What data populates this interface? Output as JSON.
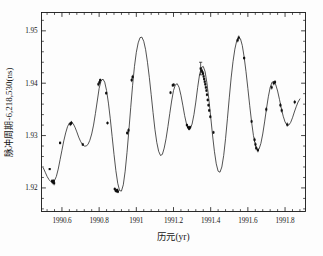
{
  "figure": {
    "background_color": "#fdfdfd",
    "ink_color": "#151515"
  },
  "axes": {
    "x_axis_label": "历元(yr)",
    "y_axis_label": "脉冲周期-6,218,530(ns)",
    "x_tick_labels": [
      "1990.6",
      "1990.8",
      "1991",
      "1991.2",
      "1991.4",
      "1991.6",
      "1991.8"
    ],
    "x_tick_values": [
      1990.6,
      1990.8,
      1991.0,
      1991.2,
      1991.4,
      1991.6,
      1991.8
    ],
    "y_tick_labels": [
      "1.92",
      "1.93",
      "1.94",
      "1.95"
    ],
    "y_tick_values": [
      1.92,
      1.93,
      1.94,
      1.95
    ]
  },
  "chart_data": {
    "type": "scatter",
    "title": "",
    "subtitle": "",
    "xlabel": "历元(yr)",
    "ylabel": "脉冲周期-6,218,530(ns)",
    "xlim": [
      1990.49,
      1991.91
    ],
    "ylim": [
      1.9155,
      1.9535
    ],
    "grid": false,
    "legend": null,
    "minor_ticks": true,
    "ticks_inward": true,
    "series": [
      {
        "name": "模型拟合曲线",
        "type": "line",
        "comment": "smooth quasi-sinusoidal model curve sampled densely",
        "x": [
          1990.5,
          1990.51,
          1990.52,
          1990.53,
          1990.54,
          1990.55,
          1990.56,
          1990.57,
          1990.58,
          1990.59,
          1990.6,
          1990.61,
          1990.62,
          1990.63,
          1990.64,
          1990.65,
          1990.66,
          1990.67,
          1990.68,
          1990.69,
          1990.7,
          1990.71,
          1990.72,
          1990.73,
          1990.74,
          1990.75,
          1990.76,
          1990.77,
          1990.78,
          1990.79,
          1990.8,
          1990.81,
          1990.82,
          1990.83,
          1990.84,
          1990.85,
          1990.86,
          1990.87,
          1990.88,
          1990.89,
          1990.9,
          1990.91,
          1990.92,
          1990.93,
          1990.94,
          1990.95,
          1990.96,
          1990.97,
          1990.98,
          1990.99,
          1991.0,
          1991.01,
          1991.02,
          1991.03,
          1991.04,
          1991.05,
          1991.06,
          1991.07,
          1991.08,
          1991.09,
          1991.1,
          1991.11,
          1991.12,
          1991.13,
          1991.14,
          1991.15,
          1991.16,
          1991.17,
          1991.18,
          1991.19,
          1991.2,
          1991.21,
          1991.22,
          1991.23,
          1991.24,
          1991.25,
          1991.26,
          1991.27,
          1991.28,
          1991.29,
          1991.3,
          1991.31,
          1991.32,
          1991.33,
          1991.34,
          1991.35,
          1991.36,
          1991.37,
          1991.38,
          1991.39,
          1991.4,
          1991.41,
          1991.42,
          1991.43,
          1991.44,
          1991.45,
          1991.46,
          1991.47,
          1991.48,
          1991.49,
          1991.5,
          1991.51,
          1991.52,
          1991.53,
          1991.54,
          1991.55,
          1991.56,
          1991.57,
          1991.58,
          1991.59,
          1991.6,
          1991.61,
          1991.62,
          1991.63,
          1991.64,
          1991.65,
          1991.66,
          1991.67,
          1991.68,
          1991.69,
          1991.7,
          1991.71,
          1991.72,
          1991.73,
          1991.74,
          1991.75,
          1991.76,
          1991.77,
          1991.78,
          1991.79,
          1991.8,
          1991.81,
          1991.82,
          1991.83,
          1991.84,
          1991.85,
          1991.86,
          1991.87,
          1991.88
        ],
        "y": [
          1.9238,
          1.923,
          1.9222,
          1.9216,
          1.9212,
          1.9211,
          1.9214,
          1.9222,
          1.9236,
          1.9254,
          1.9272,
          1.929,
          1.9305,
          1.9317,
          1.9324,
          1.9326,
          1.9323,
          1.9316,
          1.9307,
          1.9297,
          1.9289,
          1.9283,
          1.928,
          1.928,
          1.9283,
          1.9291,
          1.9303,
          1.932,
          1.9342,
          1.9366,
          1.939,
          1.9404,
          1.9408,
          1.9402,
          1.9386,
          1.9362,
          1.9332,
          1.9298,
          1.9264,
          1.9233,
          1.9209,
          1.9195,
          1.9194,
          1.9206,
          1.9232,
          1.9268,
          1.931,
          1.9354,
          1.9396,
          1.9432,
          1.9459,
          1.9477,
          1.9487,
          1.9488,
          1.948,
          1.9464,
          1.944,
          1.9411,
          1.9378,
          1.9344,
          1.9312,
          1.9287,
          1.927,
          1.9262,
          1.9264,
          1.9276,
          1.9294,
          1.9317,
          1.9342,
          1.9366,
          1.9386,
          1.9397,
          1.9399,
          1.9392,
          1.9377,
          1.9358,
          1.9338,
          1.9322,
          1.9313,
          1.9313,
          1.9322,
          1.934,
          1.9364,
          1.9392,
          1.9416,
          1.943,
          1.9432,
          1.9422,
          1.94,
          1.937,
          1.9336,
          1.9301,
          1.927,
          1.9246,
          1.9232,
          1.923,
          1.924,
          1.9262,
          1.9294,
          1.9332,
          1.9372,
          1.941,
          1.9441,
          1.9465,
          1.9481,
          1.9488,
          1.9485,
          1.9472,
          1.945,
          1.9422,
          1.939,
          1.9357,
          1.9326,
          1.93,
          1.9282,
          1.9273,
          1.9274,
          1.9285,
          1.9303,
          1.9326,
          1.9351,
          1.9374,
          1.9392,
          1.9402,
          1.9403,
          1.9397,
          1.9385,
          1.9369,
          1.9352,
          1.9337,
          1.9326,
          1.932,
          1.932,
          1.9325,
          1.9334,
          1.9345,
          1.9355,
          1.9364,
          1.937
        ]
      },
      {
        "name": "观测数据点",
        "type": "scatter",
        "marker": "square",
        "points": [
          {
            "x": 1990.534,
            "y": 1.9236,
            "yerr": 0.0
          },
          {
            "x": 1990.547,
            "y": 1.9213,
            "yerr": 0.0004
          },
          {
            "x": 1990.551,
            "y": 1.9211,
            "yerr": 0.0004
          },
          {
            "x": 1990.556,
            "y": 1.9213,
            "yerr": 0.0004
          },
          {
            "x": 1990.558,
            "y": 1.9209,
            "yerr": 0.0004
          },
          {
            "x": 1990.59,
            "y": 1.9286,
            "yerr": 0.0003
          },
          {
            "x": 1990.645,
            "y": 1.9322,
            "yerr": 0.0004
          },
          {
            "x": 1990.651,
            "y": 1.9324,
            "yerr": 0.0004
          },
          {
            "x": 1990.712,
            "y": 1.9283,
            "yerr": 0.0003
          },
          {
            "x": 1990.796,
            "y": 1.9398,
            "yerr": 0.0004
          },
          {
            "x": 1990.802,
            "y": 1.9402,
            "yerr": 0.0004
          },
          {
            "x": 1990.806,
            "y": 1.9406,
            "yerr": 0.0003
          },
          {
            "x": 1990.838,
            "y": 1.9381,
            "yerr": 0.0003
          },
          {
            "x": 1990.845,
            "y": 1.9324,
            "yerr": 0.0003
          },
          {
            "x": 1990.884,
            "y": 1.9198,
            "yerr": 0.0003
          },
          {
            "x": 1990.889,
            "y": 1.9195,
            "yerr": 0.0003
          },
          {
            "x": 1990.893,
            "y": 1.9194,
            "yerr": 0.0003
          },
          {
            "x": 1990.897,
            "y": 1.9196,
            "yerr": 0.0003
          },
          {
            "x": 1990.901,
            "y": 1.9193,
            "yerr": 0.0003
          },
          {
            "x": 1990.951,
            "y": 1.9305,
            "yerr": 0.0004
          },
          {
            "x": 1990.958,
            "y": 1.931,
            "yerr": 0.0004
          },
          {
            "x": 1990.975,
            "y": 1.9406,
            "yerr": 0.0004
          },
          {
            "x": 1990.98,
            "y": 1.9412,
            "yerr": 0.0004
          },
          {
            "x": 1991.184,
            "y": 1.9382,
            "yerr": 0.0003
          },
          {
            "x": 1991.196,
            "y": 1.9396,
            "yerr": 0.0003
          },
          {
            "x": 1991.201,
            "y": 1.9397,
            "yerr": 0.0003
          },
          {
            "x": 1991.272,
            "y": 1.932,
            "yerr": 0.0003
          },
          {
            "x": 1991.278,
            "y": 1.9316,
            "yerr": 0.0003
          },
          {
            "x": 1991.284,
            "y": 1.9313,
            "yerr": 0.0003
          },
          {
            "x": 1991.289,
            "y": 1.9316,
            "yerr": 0.0003
          },
          {
            "x": 1991.346,
            "y": 1.9428,
            "yerr": 0.0012
          },
          {
            "x": 1991.352,
            "y": 1.9424,
            "yerr": 0.0004
          },
          {
            "x": 1991.356,
            "y": 1.9421,
            "yerr": 0.0003
          },
          {
            "x": 1991.359,
            "y": 1.9418,
            "yerr": 0.0003
          },
          {
            "x": 1991.362,
            "y": 1.9413,
            "yerr": 0.0003
          },
          {
            "x": 1991.365,
            "y": 1.9408,
            "yerr": 0.0003
          },
          {
            "x": 1991.368,
            "y": 1.9403,
            "yerr": 0.0003
          },
          {
            "x": 1991.371,
            "y": 1.9398,
            "yerr": 0.0003
          },
          {
            "x": 1991.374,
            "y": 1.9392,
            "yerr": 0.0003
          },
          {
            "x": 1991.377,
            "y": 1.9386,
            "yerr": 0.0003
          },
          {
            "x": 1991.38,
            "y": 1.9378,
            "yerr": 0.0003
          },
          {
            "x": 1991.384,
            "y": 1.9368,
            "yerr": 0.0003
          },
          {
            "x": 1991.388,
            "y": 1.9358,
            "yerr": 0.0003
          },
          {
            "x": 1991.392,
            "y": 1.9348,
            "yerr": 0.0003
          },
          {
            "x": 1991.398,
            "y": 1.9336,
            "yerr": 0.0003
          },
          {
            "x": 1991.415,
            "y": 1.9306,
            "yerr": 0.0003
          },
          {
            "x": 1991.545,
            "y": 1.9482,
            "yerr": 0.0004
          },
          {
            "x": 1991.551,
            "y": 1.9487,
            "yerr": 0.0004
          },
          {
            "x": 1991.58,
            "y": 1.9448,
            "yerr": 0.0003
          },
          {
            "x": 1991.62,
            "y": 1.9327,
            "yerr": 0.0003
          },
          {
            "x": 1991.636,
            "y": 1.9292,
            "yerr": 0.0004
          },
          {
            "x": 1991.641,
            "y": 1.9283,
            "yerr": 0.0004
          },
          {
            "x": 1991.645,
            "y": 1.9276,
            "yerr": 0.0004
          },
          {
            "x": 1991.654,
            "y": 1.9272,
            "yerr": 0.0004
          },
          {
            "x": 1991.699,
            "y": 1.935,
            "yerr": 0.0004
          },
          {
            "x": 1991.728,
            "y": 1.9392,
            "yerr": 0.0004
          },
          {
            "x": 1991.739,
            "y": 1.94,
            "yerr": 0.0004
          },
          {
            "x": 1991.746,
            "y": 1.9402,
            "yerr": 0.0004
          },
          {
            "x": 1991.775,
            "y": 1.9358,
            "yerr": 0.0004
          },
          {
            "x": 1991.782,
            "y": 1.9348,
            "yerr": 0.0004
          },
          {
            "x": 1991.812,
            "y": 1.9321,
            "yerr": 0.0004
          },
          {
            "x": 1991.852,
            "y": 1.9364,
            "yerr": 0.0004
          }
        ]
      }
    ]
  }
}
